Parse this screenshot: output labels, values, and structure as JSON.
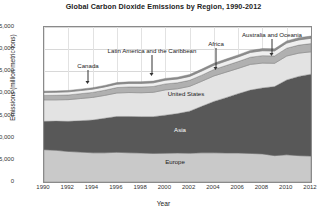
{
  "chart_data": {
    "type": "area",
    "title": "Global Carbon Dioxide Emissions by Region, 1990-2012",
    "xlabel": "Year",
    "ylabel": "Emissions (million metric tons)",
    "stacked": true,
    "grid": true,
    "legend_position": "inline-annotations",
    "xlim": [
      1990,
      2012
    ],
    "ylim": [
      0,
      35000
    ],
    "ytick_labels": [
      "0",
      "5,000",
      "10,000",
      "15,000",
      "20,000",
      "25,000",
      "30,000",
      "35,000"
    ],
    "ytick_values": [
      0,
      5000,
      10000,
      15000,
      20000,
      25000,
      30000,
      35000
    ],
    "xtick_labels": [
      "1990",
      "1992",
      "1994",
      "1996",
      "1998",
      "2000",
      "2002",
      "2004",
      "2006",
      "2008",
      "2010",
      "2012"
    ],
    "xtick_values": [
      1990,
      1992,
      1994,
      1996,
      1998,
      2000,
      2002,
      2004,
      2006,
      2008,
      2010,
      2012
    ],
    "x": [
      1990,
      1991,
      1992,
      1993,
      1994,
      1995,
      1996,
      1997,
      1998,
      1999,
      2000,
      2001,
      2002,
      2003,
      2004,
      2005,
      2006,
      2007,
      2008,
      2009,
      2010,
      2011,
      2012
    ],
    "series": [
      {
        "name": "Europe",
        "color": "#c9c9c9",
        "values": [
          7300,
          7150,
          6900,
          6750,
          6600,
          6600,
          6700,
          6600,
          6550,
          6450,
          6500,
          6550,
          6500,
          6600,
          6600,
          6550,
          6550,
          6450,
          6350,
          5950,
          6150,
          5950,
          5850
        ]
      },
      {
        "name": "Asia",
        "color": "#585858",
        "values": [
          6400,
          6600,
          6800,
          7100,
          7400,
          7800,
          8100,
          8200,
          8200,
          8300,
          8600,
          8900,
          9500,
          10500,
          11600,
          12500,
          13400,
          14300,
          14900,
          15600,
          16900,
          17900,
          18500
        ]
      },
      {
        "name": "United States",
        "color": "#e3e3e3",
        "values": [
          4850,
          4800,
          4900,
          5000,
          5100,
          5150,
          5300,
          5400,
          5400,
          5500,
          5700,
          5600,
          5600,
          5650,
          5750,
          5750,
          5700,
          5800,
          5600,
          5250,
          5400,
          5250,
          5050
        ]
      },
      {
        "name": "Latin America and the Caribbean",
        "color": "#b0b0b0",
        "values": [
          1000,
          1030,
          1060,
          1090,
          1130,
          1170,
          1220,
          1270,
          1310,
          1320,
          1350,
          1350,
          1360,
          1380,
          1450,
          1500,
          1550,
          1620,
          1680,
          1670,
          1760,
          1810,
          1850
        ]
      },
      {
        "name": "Africa",
        "color": "#efefef",
        "values": [
          680,
          690,
          700,
          710,
          730,
          750,
          770,
          790,
          810,
          820,
          840,
          860,
          890,
          930,
          970,
          1010,
          1040,
          1080,
          1110,
          1130,
          1160,
          1180,
          1200
        ]
      },
      {
        "name": "Australia and Oceania",
        "color": "#8d8d8d",
        "values": [
          290,
          300,
          310,
          320,
          330,
          340,
          350,
          360,
          380,
          390,
          400,
          410,
          420,
          430,
          440,
          450,
          460,
          470,
          480,
          480,
          490,
          500,
          500
        ]
      }
    ],
    "annotations": [
      {
        "text": "Canada",
        "id": "canada"
      },
      {
        "text": "Latin America and the Caribbean",
        "id": "latin-america"
      },
      {
        "text": "Africa",
        "id": "africa"
      },
      {
        "text": "Australia and Oceania",
        "id": "australia-oceania"
      },
      {
        "text": "United States",
        "id": "united-states"
      },
      {
        "text": "Asia",
        "id": "asia"
      },
      {
        "text": "Europe",
        "id": "europe"
      }
    ]
  }
}
